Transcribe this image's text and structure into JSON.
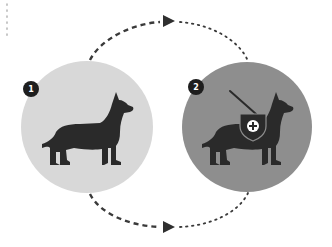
{
  "diagram": {
    "type": "cycle",
    "colors": {
      "background": "#ffffff",
      "circle_1": "#d8d8d8",
      "circle_2": "#8e8e8e",
      "silhouette": "#2a2a2a",
      "connector": "#3a3a3a",
      "badge": "#1e1e1e"
    },
    "steps": [
      {
        "number": "1",
        "label": "dog",
        "icon": "dog-icon"
      },
      {
        "number": "2",
        "label": "service dog with harness",
        "icon": "service-dog-icon",
        "emblem": "medical-cross-shield-icon"
      }
    ],
    "connectors": [
      {
        "from": "1",
        "to": "2",
        "position": "top",
        "style_before_arrow": "dashed",
        "style_after_arrow": "dotted"
      },
      {
        "from": "1",
        "to": "2",
        "position": "bottom",
        "style_before_arrow": "dashed",
        "style_after_arrow": "dotted"
      }
    ],
    "decorations": [
      {
        "type": "dotted-vertical-line",
        "position": "top-left"
      }
    ]
  }
}
